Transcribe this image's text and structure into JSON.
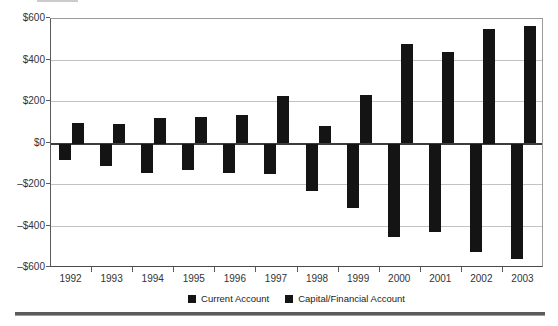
{
  "chart_data": {
    "type": "bar",
    "title": "",
    "xlabel": "",
    "ylabel": "",
    "categories": [
      "1992",
      "1993",
      "1994",
      "1995",
      "1996",
      "1997",
      "1998",
      "1999",
      "2000",
      "2001",
      "2002",
      "2003"
    ],
    "series": [
      {
        "name": "Current Account",
        "color": "#141414",
        "values": [
          -80,
          -110,
          -140,
          -130,
          -140,
          -145,
          -230,
          -310,
          -450,
          -425,
          -525,
          -555
        ]
      },
      {
        "name": "Capital/Financial Account",
        "color": "#141414",
        "values": [
          100,
          95,
          125,
          130,
          135,
          230,
          85,
          235,
          480,
          440,
          550,
          565
        ]
      }
    ],
    "ylim": [
      -600,
      600
    ],
    "ytick_step": 200,
    "ytick_labels": [
      "$600",
      "$400",
      "$200",
      "$0",
      "–$200",
      "–$400",
      "–$600"
    ],
    "grid": true,
    "gridline_color": "#c3c3c3",
    "zero_line_color": "#3d3d3d",
    "bar_color": "#141414",
    "legend_position": "bottom"
  }
}
